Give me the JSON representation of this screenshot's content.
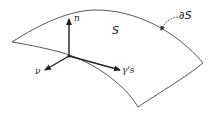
{
  "diagram": {
    "surface_label": "S",
    "boundary_label": "∂S",
    "vectors": [
      {
        "id": "normal",
        "label": "n"
      },
      {
        "id": "conormal",
        "label": "ν"
      },
      {
        "id": "tangent",
        "label": "γ's"
      }
    ],
    "colors": {
      "stroke": "#333333",
      "text": "#222222",
      "background": "#ffffff"
    }
  }
}
